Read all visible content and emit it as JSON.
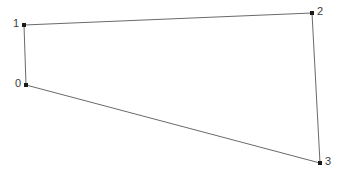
{
  "figure": {
    "type": "polygon-vertex-diagram",
    "width": 345,
    "height": 176,
    "background_color": "#ffffff",
    "edge_color": "#6a6a6a",
    "edge_width": 1,
    "marker_color": "#1a1a1a",
    "marker_size": 4,
    "label_color": "#3a3a3a",
    "label_font_size": 11
  },
  "chart_data": {
    "type": "scatter",
    "title": "",
    "subtitle": "",
    "xlabel": "",
    "ylabel": "",
    "grid": false,
    "legend": null,
    "axis_visible": false,
    "tick_labels": [],
    "xlim": [
      0,
      345
    ],
    "ylim": [
      0,
      176
    ],
    "closed_path": true,
    "point_labels": [
      "0",
      "1",
      "2",
      "3"
    ],
    "x": [
      26,
      24,
      312,
      320
    ],
    "y": [
      85,
      25,
      13,
      163
    ],
    "points": [
      {
        "label": "0",
        "x": 26,
        "y": 85,
        "label_side": "left"
      },
      {
        "label": "1",
        "x": 24,
        "y": 25,
        "label_side": "left"
      },
      {
        "label": "2",
        "x": 312,
        "y": 13,
        "label_side": "right"
      },
      {
        "label": "3",
        "x": 320,
        "y": 163,
        "label_side": "right"
      }
    ],
    "edges": [
      {
        "name": "edge-0-1",
        "from": "0",
        "to": "1"
      },
      {
        "name": "edge-1-2",
        "from": "1",
        "to": "2"
      },
      {
        "name": "edge-2-3",
        "from": "2",
        "to": "3"
      },
      {
        "name": "edge-3-0",
        "from": "3",
        "to": "0"
      }
    ]
  }
}
